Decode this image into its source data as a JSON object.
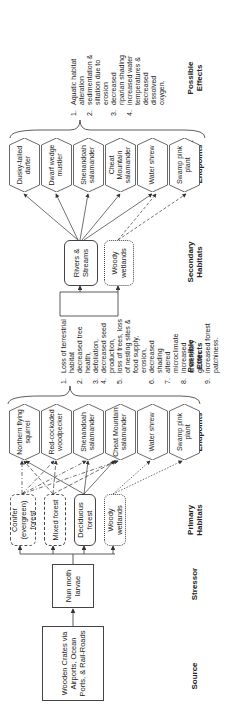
{
  "headers": {
    "source": "Source",
    "stressor": "Stressor",
    "primary_habitats": "Primary Habitats",
    "assessment_endpoints_1": "Assessment Endpoints",
    "possible_effects_1": "Possible Effects",
    "secondary_habitats": "Secondary Habitats",
    "assessment_endpoints_2": "Assessment Endpoints",
    "possible_effects_2": "Possible Effects"
  },
  "source": {
    "label": "Wooden Crates via Airports, Ocean Ports, & Rail-Roads"
  },
  "stressor": {
    "label": "Nun moth larvae"
  },
  "primary_habitats": [
    {
      "label": "Conifer (evergreen) forest",
      "border": "dash-dot"
    },
    {
      "label": "Mixed forest",
      "border": "dashed"
    },
    {
      "label": "Deciduous forest",
      "border": "solid"
    },
    {
      "label": "Woody wetlands",
      "border": "dotted"
    }
  ],
  "endpoints_1": [
    {
      "label": "Northern flying squirrel"
    },
    {
      "label": "Red-cockaded woodpecker"
    },
    {
      "label": "Shenandoah salamander"
    },
    {
      "label": "Cheat Mountain salamander"
    },
    {
      "label": "Water shrew"
    },
    {
      "label": "Swamp pink plant"
    }
  ],
  "effects_1": [
    {
      "n": "1.",
      "text": "Loss of terrestrial habitat"
    },
    {
      "n": "2.",
      "text": "decreased tree health,"
    },
    {
      "n": "3.",
      "text": "defoliation,"
    },
    {
      "n": "4.",
      "text": "decreased seed production,"
    },
    {
      "n": "5.",
      "text": "loss of trees, loss of nesting sites & food supply,"
    },
    {
      "n": "",
      "text": "erosion,"
    },
    {
      "n": "6.",
      "text": "decreased shading"
    },
    {
      "n": "7.",
      "text": "altered microclimate"
    },
    {
      "n": "8.",
      "text": "increased understory growth"
    },
    {
      "n": "9.",
      "text": "increased forest patchiness."
    }
  ],
  "secondary_habitats": [
    {
      "label": "Rivers & Streams",
      "border": "solid"
    },
    {
      "label": "Woody wetlands",
      "border": "dotted"
    }
  ],
  "endpoints_2": [
    {
      "label": "Dusky-tailed darter"
    },
    {
      "label": "Dwarf wedge mustler"
    },
    {
      "label": "Shenandoah salamander"
    },
    {
      "label": "Cheat Mountain salamander"
    },
    {
      "label": "Water shrew"
    },
    {
      "label": "Swamp pink plant"
    }
  ],
  "effects_2": [
    {
      "n": "1.",
      "text": "Aquatic habitat alteration"
    },
    {
      "n": "2.",
      "text": "sedimentation & siltation due to erosion"
    },
    {
      "n": "3.",
      "text": "decreased riparian shading"
    },
    {
      "n": "4.",
      "text": "increased water temperatures & decreased dissolved oxygen."
    }
  ]
}
